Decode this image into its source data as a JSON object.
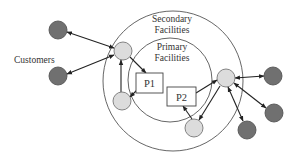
{
  "diagram": {
    "type": "facility-network",
    "labels": {
      "customers": "Customers",
      "secondary_line1": "Secondary",
      "secondary_line2": "Facilities",
      "primary_line1": "Primary",
      "primary_line2": "Facilities"
    },
    "primary_facilities": [
      {
        "id": "P1",
        "label": "P1"
      },
      {
        "id": "P2",
        "label": "P2"
      }
    ],
    "secondary_facilities": [
      {
        "id": "S-left-top"
      },
      {
        "id": "S-left-bottom"
      },
      {
        "id": "S-right"
      },
      {
        "id": "S-bottom"
      }
    ],
    "customers": [
      {
        "id": "C-left-1"
      },
      {
        "id": "C-left-2"
      },
      {
        "id": "C-right-1"
      },
      {
        "id": "C-right-2"
      },
      {
        "id": "C-right-3"
      }
    ],
    "connections": [
      {
        "from": "C-left-1",
        "to": "S-left-top",
        "direction": "bidirectional"
      },
      {
        "from": "C-left-2",
        "to": "S-left-top",
        "direction": "bidirectional"
      },
      {
        "from": "S-left-top",
        "to": "P1",
        "direction": "forward"
      },
      {
        "from": "S-left-bottom",
        "to": "S-left-top",
        "direction": "forward"
      },
      {
        "from": "P1",
        "to": "S-left-bottom",
        "direction": "forward"
      },
      {
        "from": "P2",
        "to": "S-right",
        "direction": "forward"
      },
      {
        "from": "S-right",
        "to": "S-bottom",
        "direction": "forward"
      },
      {
        "from": "S-bottom",
        "to": "P2",
        "direction": "forward"
      },
      {
        "from": "S-right",
        "to": "C-right-1",
        "direction": "bidirectional"
      },
      {
        "from": "S-right",
        "to": "C-right-2",
        "direction": "bidirectional"
      },
      {
        "from": "S-right",
        "to": "C-right-3",
        "direction": "bidirectional"
      }
    ],
    "colors": {
      "customer_fill": "#707070",
      "facility_fill": "#dcdcdc",
      "ring_stroke": "#555555",
      "arrow": "#222222"
    }
  }
}
